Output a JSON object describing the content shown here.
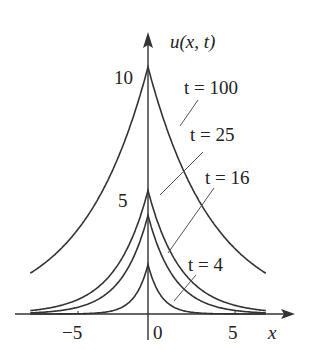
{
  "chart_data": {
    "type": "line",
    "title": "",
    "xlabel": "x",
    "ylabel": "u(x, t)",
    "x_ticks": [
      "-5",
      "0",
      "5"
    ],
    "y_ticks": [
      "5",
      "10"
    ],
    "xlim": [
      -7.5,
      7.5
    ],
    "ylim": [
      0,
      10
    ],
    "grid": false,
    "legend": "inline labels with leader lines",
    "series": [
      {
        "name": "t = 100",
        "t": 100,
        "peak": 10
      },
      {
        "name": "t = 25",
        "t": 25,
        "peak": 5
      },
      {
        "name": "t = 16",
        "t": 16,
        "peak": 4
      },
      {
        "name": "t = 4",
        "t": 4,
        "peak": 2
      }
    ],
    "annotations": [
      "t = 100",
      "t = 25",
      "t = 16",
      "t = 4"
    ]
  },
  "axes": {
    "y_label": "u(x, t)",
    "x_label": "x",
    "tick_minus5": "−5",
    "tick_0": "0",
    "tick_5": "5",
    "tick_y5": "5",
    "tick_y10": "10"
  },
  "labels": {
    "t100": "t = 100",
    "t25": "t = 25",
    "t16": "t = 16",
    "t4": "t = 4"
  },
  "colors": {
    "line": "#333333"
  }
}
